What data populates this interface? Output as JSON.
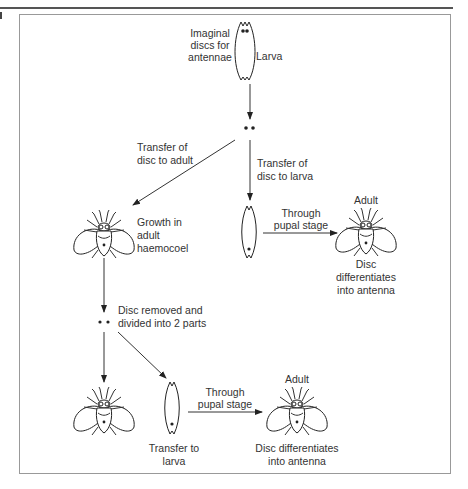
{
  "figure": {
    "top_label": {
      "line1": "Imaginal",
      "line2": "discs for",
      "line3": "antennae"
    },
    "larva_label": "Larva",
    "transfer_adult": {
      "line1": "Transfer of",
      "line2": "disc to adult"
    },
    "transfer_larva": {
      "line1": "Transfer of",
      "line2": "disc to larva"
    },
    "growth": {
      "line1": "Growth in",
      "line2": "adult",
      "line3": "haemocoel"
    },
    "pupal_stage_1": {
      "line1": "Through",
      "line2": "pupal stage"
    },
    "adult_label_1": "Adult",
    "differentiates_1": {
      "line1": "Disc",
      "line2": "differentiates",
      "line3": "into antenna"
    },
    "disc_removed": {
      "line1": "Disc removed and",
      "line2": "divided into 2 parts"
    },
    "pupal_stage_2": {
      "line1": "Through",
      "line2": "pupal stage"
    },
    "adult_label_2": "Adult",
    "transfer_to_larva": {
      "line1": "Transfer to",
      "line2": "larva"
    },
    "differentiates_2": {
      "line1": "Disc differentiates",
      "line2": "into antenna"
    }
  },
  "icons": [
    "larva-icon",
    "disc-dots-icon",
    "adult-fly-icon",
    "arrow-icon"
  ],
  "colors": {
    "line": "#333333",
    "frame": "#999999",
    "background": "#ffffff"
  }
}
